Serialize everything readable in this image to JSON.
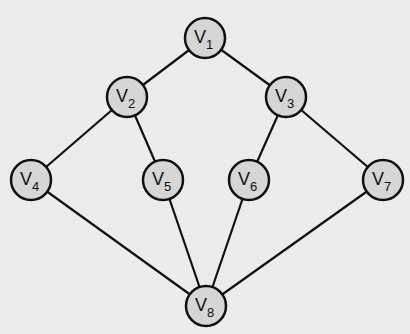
{
  "diagram": {
    "type": "graph",
    "background": "#ececec",
    "node_fill": "#d6d6d6",
    "stroke": "#111111",
    "nodes": [
      {
        "id": "v1",
        "label": "V",
        "sub": "1",
        "x": 205,
        "y": 38
      },
      {
        "id": "v2",
        "label": "V",
        "sub": "2",
        "x": 127,
        "y": 97
      },
      {
        "id": "v3",
        "label": "V",
        "sub": "3",
        "x": 286,
        "y": 97
      },
      {
        "id": "v4",
        "label": "V",
        "sub": "4",
        "x": 31,
        "y": 180
      },
      {
        "id": "v5",
        "label": "V",
        "sub": "5",
        "x": 163,
        "y": 180
      },
      {
        "id": "v6",
        "label": "V",
        "sub": "6",
        "x": 249,
        "y": 180
      },
      {
        "id": "v7",
        "label": "V",
        "sub": "7",
        "x": 383,
        "y": 180
      },
      {
        "id": "v8",
        "label": "V",
        "sub": "8",
        "x": 206,
        "y": 306
      }
    ],
    "edges": [
      [
        "v1",
        "v2"
      ],
      [
        "v1",
        "v3"
      ],
      [
        "v2",
        "v4"
      ],
      [
        "v2",
        "v5"
      ],
      [
        "v3",
        "v6"
      ],
      [
        "v3",
        "v7"
      ],
      [
        "v4",
        "v8"
      ],
      [
        "v5",
        "v8"
      ],
      [
        "v6",
        "v8"
      ],
      [
        "v7",
        "v8"
      ]
    ]
  }
}
